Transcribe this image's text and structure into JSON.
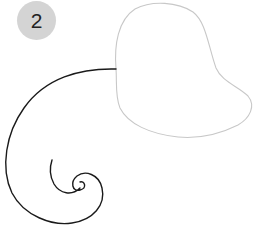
{
  "step_badge": {
    "number": "2",
    "color": "#d4d4d4"
  },
  "shapes": {
    "balloon": {
      "stroke": "#c8c8c8"
    },
    "string": {
      "stroke": "#1a1a1a"
    }
  }
}
